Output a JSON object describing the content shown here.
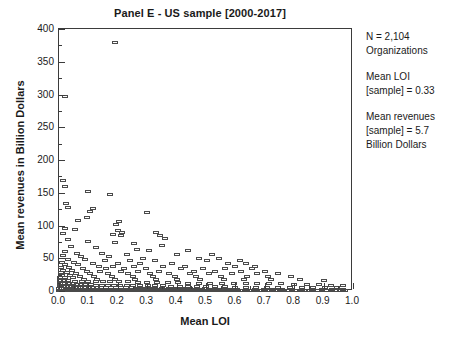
{
  "chart_data": {
    "type": "scatter",
    "title": "Panel E - US sample [2000-2017]",
    "xlabel": "Mean LOI",
    "ylabel": "Mean revenues in Billion Dollars",
    "xlim": [
      0.0,
      1.0
    ],
    "ylim": [
      0,
      400
    ],
    "xticks": [
      "0.0",
      "0.1",
      "0.2",
      "0.3",
      "0.4",
      "0.5",
      "0.6",
      "0.7",
      "0.8",
      "0.9",
      "1.0"
    ],
    "yticks": [
      "0",
      "50",
      "100",
      "150",
      "200",
      "250",
      "300",
      "350",
      "400"
    ],
    "x_major_step": 0.1,
    "x_minor_step": 0.05,
    "y_major_step": 50,
    "y_minor_step": 25,
    "grid": false,
    "legend": false,
    "marker_style": "open-rectangle",
    "marker_color": "#4a4a4a",
    "points": [
      [
        0.19,
        380
      ],
      [
        0.02,
        297
      ],
      [
        0.015,
        168
      ],
      [
        0.02,
        160
      ],
      [
        0.1,
        152
      ],
      [
        0.175,
        148
      ],
      [
        0.025,
        133
      ],
      [
        0.03,
        128
      ],
      [
        0.115,
        126
      ],
      [
        0.105,
        122
      ],
      [
        0.3,
        120
      ],
      [
        0.095,
        112
      ],
      [
        0.065,
        108
      ],
      [
        0.205,
        106
      ],
      [
        0.195,
        102
      ],
      [
        0.02,
        96
      ],
      [
        0.055,
        94
      ],
      [
        0.2,
        92
      ],
      [
        0.215,
        90
      ],
      [
        0.33,
        90
      ],
      [
        0.015,
        88
      ],
      [
        0.185,
        86
      ],
      [
        0.21,
        84
      ],
      [
        0.345,
        84
      ],
      [
        0.36,
        80
      ],
      [
        0.03,
        78
      ],
      [
        0.1,
        76
      ],
      [
        0.19,
        74
      ],
      [
        0.255,
        72
      ],
      [
        0.35,
        70
      ],
      [
        0.04,
        68
      ],
      [
        0.125,
        66
      ],
      [
        0.265,
        64
      ],
      [
        0.305,
        62
      ],
      [
        0.44,
        62
      ],
      [
        0.02,
        60
      ],
      [
        0.06,
        58
      ],
      [
        0.145,
        58
      ],
      [
        0.23,
        56
      ],
      [
        0.4,
        56
      ],
      [
        0.52,
        56
      ],
      [
        0.015,
        54
      ],
      [
        0.075,
        52
      ],
      [
        0.17,
        52
      ],
      [
        0.285,
        50
      ],
      [
        0.475,
        50
      ],
      [
        0.545,
        50
      ],
      [
        0.03,
        48
      ],
      [
        0.09,
        48
      ],
      [
        0.155,
        46
      ],
      [
        0.24,
        46
      ],
      [
        0.325,
        46
      ],
      [
        0.505,
        46
      ],
      [
        0.615,
        46
      ],
      [
        0.01,
        44
      ],
      [
        0.05,
        44
      ],
      [
        0.115,
        42
      ],
      [
        0.2,
        42
      ],
      [
        0.275,
        42
      ],
      [
        0.385,
        42
      ],
      [
        0.575,
        42
      ],
      [
        0.635,
        42
      ],
      [
        0.02,
        40
      ],
      [
        0.065,
        40
      ],
      [
        0.135,
        38
      ],
      [
        0.185,
        38
      ],
      [
        0.255,
        38
      ],
      [
        0.355,
        38
      ],
      [
        0.43,
        38
      ],
      [
        0.6,
        38
      ],
      [
        0.665,
        38
      ],
      [
        0.008,
        36
      ],
      [
        0.035,
        36
      ],
      [
        0.08,
        34
      ],
      [
        0.16,
        34
      ],
      [
        0.22,
        34
      ],
      [
        0.295,
        34
      ],
      [
        0.415,
        34
      ],
      [
        0.49,
        34
      ],
      [
        0.565,
        34
      ],
      [
        0.655,
        34
      ],
      [
        0.012,
        32
      ],
      [
        0.045,
        32
      ],
      [
        0.095,
        30
      ],
      [
        0.14,
        30
      ],
      [
        0.21,
        30
      ],
      [
        0.27,
        30
      ],
      [
        0.34,
        30
      ],
      [
        0.46,
        30
      ],
      [
        0.53,
        30
      ],
      [
        0.62,
        30
      ],
      [
        0.7,
        30
      ],
      [
        0.006,
        28
      ],
      [
        0.028,
        28
      ],
      [
        0.058,
        26
      ],
      [
        0.105,
        26
      ],
      [
        0.165,
        26
      ],
      [
        0.235,
        26
      ],
      [
        0.31,
        26
      ],
      [
        0.375,
        26
      ],
      [
        0.445,
        26
      ],
      [
        0.51,
        26
      ],
      [
        0.59,
        26
      ],
      [
        0.675,
        26
      ],
      [
        0.745,
        26
      ],
      [
        0.01,
        24
      ],
      [
        0.038,
        24
      ],
      [
        0.07,
        22
      ],
      [
        0.12,
        22
      ],
      [
        0.18,
        22
      ],
      [
        0.25,
        22
      ],
      [
        0.32,
        22
      ],
      [
        0.395,
        22
      ],
      [
        0.465,
        22
      ],
      [
        0.55,
        22
      ],
      [
        0.64,
        22
      ],
      [
        0.71,
        22
      ],
      [
        0.79,
        22
      ],
      [
        0.005,
        20
      ],
      [
        0.022,
        20
      ],
      [
        0.048,
        20
      ],
      [
        0.085,
        18
      ],
      [
        0.13,
        18
      ],
      [
        0.19,
        18
      ],
      [
        0.26,
        18
      ],
      [
        0.33,
        18
      ],
      [
        0.4,
        18
      ],
      [
        0.48,
        18
      ],
      [
        0.56,
        18
      ],
      [
        0.63,
        18
      ],
      [
        0.72,
        18
      ],
      [
        0.82,
        18
      ],
      [
        0.9,
        16
      ],
      [
        0.004,
        16
      ],
      [
        0.018,
        16
      ],
      [
        0.032,
        16
      ],
      [
        0.055,
        15
      ],
      [
        0.078,
        15
      ],
      [
        0.1,
        15
      ],
      [
        0.125,
        14
      ],
      [
        0.15,
        14
      ],
      [
        0.175,
        14
      ],
      [
        0.205,
        14
      ],
      [
        0.235,
        14
      ],
      [
        0.27,
        13
      ],
      [
        0.3,
        13
      ],
      [
        0.335,
        13
      ],
      [
        0.37,
        13
      ],
      [
        0.405,
        13
      ],
      [
        0.44,
        12
      ],
      [
        0.475,
        12
      ],
      [
        0.515,
        12
      ],
      [
        0.555,
        12
      ],
      [
        0.595,
        12
      ],
      [
        0.635,
        11
      ],
      [
        0.675,
        11
      ],
      [
        0.715,
        11
      ],
      [
        0.755,
        11
      ],
      [
        0.8,
        10
      ],
      [
        0.845,
        10
      ],
      [
        0.885,
        10
      ],
      [
        0.925,
        9
      ],
      [
        0.965,
        9
      ],
      [
        0.003,
        12
      ],
      [
        0.012,
        12
      ],
      [
        0.022,
        11
      ],
      [
        0.034,
        11
      ],
      [
        0.046,
        11
      ],
      [
        0.06,
        10
      ],
      [
        0.074,
        10
      ],
      [
        0.09,
        10
      ],
      [
        0.108,
        10
      ],
      [
        0.126,
        9
      ],
      [
        0.145,
        9
      ],
      [
        0.165,
        9
      ],
      [
        0.186,
        9
      ],
      [
        0.208,
        9
      ],
      [
        0.23,
        8
      ],
      [
        0.253,
        8
      ],
      [
        0.277,
        8
      ],
      [
        0.302,
        8
      ],
      [
        0.328,
        8
      ],
      [
        0.355,
        8
      ],
      [
        0.382,
        7
      ],
      [
        0.41,
        7
      ],
      [
        0.44,
        7
      ],
      [
        0.47,
        7
      ],
      [
        0.5,
        7
      ],
      [
        0.532,
        7
      ],
      [
        0.565,
        7
      ],
      [
        0.6,
        6
      ],
      [
        0.635,
        6
      ],
      [
        0.67,
        6
      ],
      [
        0.707,
        6
      ],
      [
        0.745,
        6
      ],
      [
        0.785,
        6
      ],
      [
        0.825,
        5
      ],
      [
        0.865,
        5
      ],
      [
        0.905,
        5
      ],
      [
        0.945,
        5
      ],
      [
        0.002,
        8
      ],
      [
        0.008,
        8
      ],
      [
        0.015,
        7
      ],
      [
        0.024,
        7
      ],
      [
        0.033,
        7
      ],
      [
        0.043,
        7
      ],
      [
        0.053,
        6
      ],
      [
        0.064,
        6
      ],
      [
        0.076,
        6
      ],
      [
        0.088,
        6
      ],
      [
        0.101,
        6
      ],
      [
        0.115,
        6
      ],
      [
        0.129,
        5
      ],
      [
        0.144,
        5
      ],
      [
        0.16,
        5
      ],
      [
        0.176,
        5
      ],
      [
        0.193,
        5
      ],
      [
        0.21,
        5
      ],
      [
        0.228,
        5
      ],
      [
        0.247,
        5
      ],
      [
        0.266,
        4
      ],
      [
        0.286,
        4
      ],
      [
        0.307,
        4
      ],
      [
        0.328,
        4
      ],
      [
        0.35,
        4
      ],
      [
        0.373,
        4
      ],
      [
        0.396,
        4
      ],
      [
        0.42,
        4
      ],
      [
        0.445,
        4
      ],
      [
        0.47,
        4
      ],
      [
        0.496,
        4
      ],
      [
        0.523,
        3
      ],
      [
        0.55,
        3
      ],
      [
        0.578,
        3
      ],
      [
        0.607,
        3
      ],
      [
        0.636,
        3
      ],
      [
        0.666,
        3
      ],
      [
        0.697,
        3
      ],
      [
        0.728,
        3
      ],
      [
        0.76,
        3
      ],
      [
        0.793,
        3
      ],
      [
        0.826,
        3
      ],
      [
        0.86,
        2
      ],
      [
        0.895,
        2
      ],
      [
        0.93,
        2
      ],
      [
        0.966,
        2
      ],
      [
        0.0015,
        4
      ],
      [
        0.006,
        4
      ],
      [
        0.011,
        4
      ],
      [
        0.017,
        4
      ],
      [
        0.023,
        3
      ],
      [
        0.03,
        3
      ],
      [
        0.037,
        3
      ],
      [
        0.045,
        3
      ],
      [
        0.053,
        3
      ],
      [
        0.062,
        3
      ],
      [
        0.071,
        3
      ],
      [
        0.081,
        3
      ],
      [
        0.091,
        3
      ],
      [
        0.102,
        3
      ],
      [
        0.113,
        2
      ],
      [
        0.125,
        2
      ],
      [
        0.137,
        2
      ],
      [
        0.15,
        2
      ],
      [
        0.163,
        2
      ],
      [
        0.177,
        2
      ],
      [
        0.191,
        2
      ],
      [
        0.206,
        2
      ],
      [
        0.221,
        2
      ],
      [
        0.237,
        2
      ],
      [
        0.253,
        2
      ],
      [
        0.27,
        2
      ],
      [
        0.287,
        2
      ],
      [
        0.305,
        2
      ],
      [
        0.323,
        2
      ],
      [
        0.342,
        2
      ],
      [
        0.361,
        2
      ],
      [
        0.381,
        2
      ],
      [
        0.401,
        2
      ],
      [
        0.422,
        2
      ],
      [
        0.443,
        2
      ],
      [
        0.465,
        2
      ],
      [
        0.487,
        2
      ],
      [
        0.51,
        2
      ],
      [
        0.533,
        2
      ],
      [
        0.557,
        2
      ],
      [
        0.581,
        2
      ],
      [
        0.606,
        1
      ],
      [
        0.631,
        1
      ],
      [
        0.657,
        1
      ],
      [
        0.683,
        1
      ],
      [
        0.71,
        1
      ],
      [
        0.737,
        1
      ],
      [
        0.765,
        1
      ],
      [
        0.793,
        1
      ],
      [
        0.822,
        1
      ],
      [
        0.851,
        1
      ],
      [
        0.881,
        1
      ],
      [
        0.911,
        1
      ],
      [
        0.942,
        1
      ],
      [
        0.973,
        1
      ],
      [
        0.001,
        1
      ],
      [
        0.004,
        1
      ],
      [
        0.008,
        1
      ],
      [
        0.013,
        1
      ],
      [
        0.018,
        1
      ],
      [
        0.024,
        1
      ],
      [
        0.03,
        1
      ],
      [
        0.037,
        1
      ],
      [
        0.044,
        1
      ],
      [
        0.051,
        1
      ],
      [
        0.059,
        1
      ],
      [
        0.067,
        1
      ],
      [
        0.076,
        1
      ],
      [
        0.085,
        1
      ],
      [
        0.095,
        1
      ],
      [
        0.105,
        1
      ],
      [
        0.116,
        1
      ],
      [
        0.127,
        1
      ],
      [
        0.139,
        1
      ],
      [
        0.151,
        1
      ],
      [
        0.164,
        1
      ],
      [
        0.177,
        1
      ],
      [
        0.191,
        1
      ],
      [
        0.205,
        1
      ],
      [
        0.22,
        1
      ],
      [
        0.235,
        1
      ],
      [
        0.251,
        1
      ],
      [
        0.267,
        1
      ],
      [
        0.284,
        1
      ],
      [
        0.301,
        1
      ],
      [
        0.319,
        1
      ],
      [
        0.337,
        1
      ],
      [
        0.356,
        1
      ],
      [
        0.375,
        1
      ],
      [
        0.395,
        1
      ],
      [
        0.415,
        1
      ],
      [
        0.436,
        1
      ],
      [
        0.457,
        1
      ],
      [
        0.479,
        1
      ],
      [
        0.501,
        1
      ],
      [
        0.524,
        1
      ],
      [
        0.547,
        1
      ],
      [
        0.571,
        1
      ],
      [
        0.595,
        1
      ],
      [
        0.62,
        1
      ],
      [
        0.645,
        1
      ],
      [
        0.671,
        1
      ],
      [
        0.697,
        1
      ],
      [
        0.724,
        1
      ],
      [
        0.751,
        1
      ],
      [
        0.779,
        1
      ],
      [
        0.807,
        1
      ],
      [
        0.836,
        1
      ],
      [
        0.865,
        1
      ],
      [
        0.895,
        1
      ],
      [
        0.925,
        1
      ],
      [
        0.956,
        1
      ],
      [
        0.0008,
        0.5
      ],
      [
        0.005,
        0.5
      ],
      [
        0.01,
        0.5
      ],
      [
        0.016,
        0.5
      ],
      [
        0.022,
        0.5
      ],
      [
        0.029,
        0.5
      ],
      [
        0.036,
        0.5
      ],
      [
        0.043,
        0.5
      ],
      [
        0.05,
        0.5
      ],
      [
        0.058,
        0.5
      ],
      [
        0.066,
        0.5
      ],
      [
        0.075,
        0.5
      ],
      [
        0.084,
        0.5
      ],
      [
        0.094,
        0.5
      ],
      [
        0.104,
        0.5
      ],
      [
        0.114,
        0.5
      ],
      [
        0.125,
        0.5
      ],
      [
        0.136,
        0.5
      ],
      [
        0.148,
        0.5
      ],
      [
        0.16,
        0.5
      ],
      [
        0.173,
        0.5
      ],
      [
        0.186,
        0.5
      ],
      [
        0.2,
        0.5
      ],
      [
        0.214,
        0.5
      ],
      [
        0.229,
        0.5
      ],
      [
        0.244,
        0.5
      ],
      [
        0.26,
        0.5
      ],
      [
        0.276,
        0.5
      ],
      [
        0.293,
        0.5
      ],
      [
        0.31,
        0.5
      ],
      [
        0.328,
        0.5
      ],
      [
        0.346,
        0.5
      ],
      [
        0.365,
        0.5
      ],
      [
        0.384,
        0.5
      ],
      [
        0.404,
        0.5
      ],
      [
        0.425,
        0.5
      ],
      [
        0.446,
        0.5
      ],
      [
        0.468,
        0.5
      ],
      [
        0.49,
        0.5
      ],
      [
        0.513,
        0.5
      ],
      [
        0.536,
        0.5
      ],
      [
        0.56,
        0.5
      ],
      [
        0.585,
        0.5
      ],
      [
        0.61,
        0.5
      ],
      [
        0.636,
        0.5
      ],
      [
        0.662,
        0.5
      ],
      [
        0.689,
        0.5
      ],
      [
        0.717,
        0.5
      ],
      [
        0.745,
        0.5
      ],
      [
        0.774,
        0.5
      ],
      [
        0.803,
        0.5
      ],
      [
        0.833,
        0.5
      ],
      [
        0.864,
        0.5
      ],
      [
        0.895,
        0.5
      ],
      [
        0.927,
        0.5
      ],
      [
        0.96,
        0.5
      ]
    ]
  },
  "annotations": {
    "sample_size": {
      "line1": "N = 2,104",
      "line2": "Organizations"
    },
    "mean_loi": {
      "line1": "Mean LOI",
      "line2": "[sample] = 0.33"
    },
    "mean_revenues": {
      "line1": "Mean revenues",
      "line2": "[sample] = 5.7",
      "line3": "Billion Dollars"
    }
  }
}
